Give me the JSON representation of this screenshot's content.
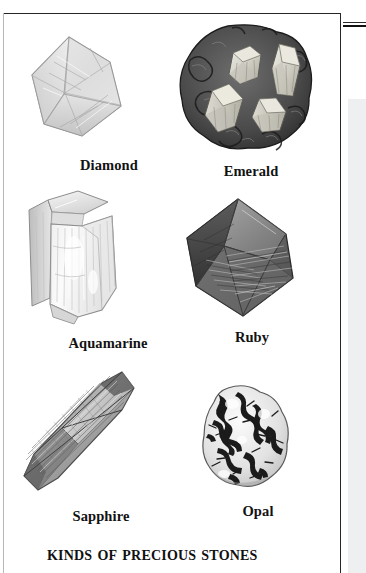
{
  "figure": {
    "title": "Kinds of Precious Stones",
    "panel_background": "#ffffff",
    "border_color": "#262626",
    "caption_color": "#121212",
    "right_panel_color": "#edeff1"
  },
  "specimens": [
    {
      "id": "diamond",
      "label": "Diamond",
      "icon": "diamond-crystal-illustration",
      "description": "pale octahedral crystal"
    },
    {
      "id": "emerald",
      "label": "Emerald",
      "icon": "emerald-in-matrix-illustration",
      "description": "light hexagonal prisms in dark rock matrix"
    },
    {
      "id": "aquamarine",
      "label": "Aquamarine",
      "icon": "aquamarine-crystal-illustration",
      "description": "pale prismatic beryl crystal"
    },
    {
      "id": "ruby",
      "label": "Ruby",
      "icon": "ruby-crystal-illustration",
      "description": "grey bipyramidal striated crystal"
    },
    {
      "id": "sapphire",
      "label": "Sapphire",
      "icon": "sapphire-crystal-illustration",
      "description": "elongated barrel bipyramid crystal"
    },
    {
      "id": "opal",
      "label": "Opal",
      "icon": "opal-nodule-illustration",
      "description": "light nodule with dark dendritic markings"
    }
  ]
}
